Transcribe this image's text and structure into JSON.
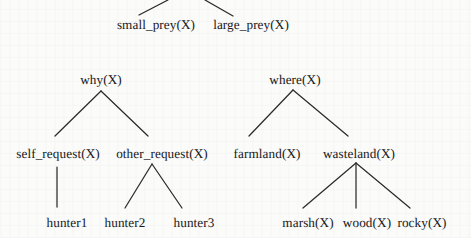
{
  "figure": {
    "kind": "predicate-decision-trees",
    "background_color": "#fbfbfa",
    "ink_color": "#18181a",
    "edge_color": "#2b2b2e",
    "width": 471,
    "height": 238
  },
  "nodes": {
    "small_prey": {
      "label": "small_prey(X)",
      "cx": 156,
      "baseline_y": 30
    },
    "large_prey": {
      "label": "large_prey(X)",
      "cx": 251,
      "baseline_y": 30
    },
    "why": {
      "label": "why(X)",
      "cx": 101,
      "baseline_y": 85
    },
    "where": {
      "label": "where(X)",
      "cx": 295,
      "baseline_y": 85
    },
    "self_request": {
      "label": "self_request(X)",
      "cx": 58,
      "baseline_y": 159
    },
    "other_request": {
      "label": "other_request(X)",
      "cx": 162,
      "baseline_y": 159
    },
    "farmland": {
      "label": "farmland(X)",
      "cx": 267,
      "baseline_y": 159
    },
    "wasteland": {
      "label": "wasteland(X)",
      "cx": 359,
      "baseline_y": 159
    },
    "hunter1": {
      "label": "hunter1",
      "cx": 67,
      "baseline_y": 228
    },
    "hunter2": {
      "label": "hunter2",
      "cx": 125,
      "baseline_y": 228
    },
    "hunter3": {
      "label": "hunter3",
      "cx": 194,
      "baseline_y": 228
    },
    "marsh": {
      "label": "marsh(X)",
      "cx": 308,
      "baseline_y": 228
    },
    "wood": {
      "label": "wood(X)",
      "cx": 367,
      "baseline_y": 228
    },
    "rocky": {
      "label": "rocky(X)",
      "cx": 422,
      "baseline_y": 228
    }
  },
  "edges": [
    {
      "name": "hidden-parent-to-small_prey",
      "x1": 168,
      "y1": 0,
      "x2": 139,
      "y2": 15
    },
    {
      "name": "hidden-parent-to-large_prey",
      "x1": 205,
      "y1": 0,
      "x2": 233,
      "y2": 16
    },
    {
      "name": "why-to-self_request",
      "x1": 101,
      "y1": 91,
      "x2": 55,
      "y2": 136
    },
    {
      "name": "why-to-other_request",
      "x1": 101,
      "y1": 91,
      "x2": 148,
      "y2": 136
    },
    {
      "name": "where-to-farmland",
      "x1": 293,
      "y1": 90,
      "x2": 249,
      "y2": 136
    },
    {
      "name": "where-to-wasteland",
      "x1": 293,
      "y1": 90,
      "x2": 348,
      "y2": 136
    },
    {
      "name": "self_request-to-hunter1",
      "x1": 57,
      "y1": 167,
      "x2": 57,
      "y2": 207
    },
    {
      "name": "other_request-to-hunter2",
      "x1": 152,
      "y1": 164,
      "x2": 125,
      "y2": 208
    },
    {
      "name": "other_request-to-hunter3",
      "x1": 152,
      "y1": 164,
      "x2": 182,
      "y2": 208
    },
    {
      "name": "wasteland-to-marsh",
      "x1": 356,
      "y1": 163,
      "x2": 303,
      "y2": 208
    },
    {
      "name": "wasteland-to-wood",
      "x1": 356,
      "y1": 163,
      "x2": 356,
      "y2": 208
    },
    {
      "name": "wasteland-to-rocky",
      "x1": 356,
      "y1": 163,
      "x2": 410,
      "y2": 208
    }
  ]
}
